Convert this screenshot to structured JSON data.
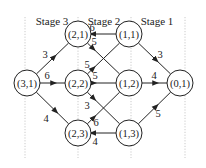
{
  "diagram": {
    "stages": [
      {
        "label": "Stage 3",
        "x": 52,
        "y": 25
      },
      {
        "label": "Stage 2",
        "x": 104,
        "y": 25
      },
      {
        "label": "Stage 1",
        "x": 157,
        "y": 25
      }
    ],
    "guides_x": [
      25,
      78,
      131,
      185
    ],
    "guides_y": [
      17,
      158
    ],
    "node_radius": 13,
    "nodes": [
      {
        "id": "3,1",
        "label": "(3,1)",
        "x": 27,
        "y": 83
      },
      {
        "id": "2,1",
        "label": "(2,1)",
        "x": 78,
        "y": 34
      },
      {
        "id": "2,2",
        "label": "(2,2)",
        "x": 78,
        "y": 83
      },
      {
        "id": "2,3",
        "label": "(2,3)",
        "x": 78,
        "y": 133
      },
      {
        "id": "1,1",
        "label": "(1,1)",
        "x": 129,
        "y": 34
      },
      {
        "id": "1,2",
        "label": "(1,2)",
        "x": 129,
        "y": 83
      },
      {
        "id": "1,3",
        "label": "(1,3)",
        "x": 129,
        "y": 133
      },
      {
        "id": "0,1",
        "label": "(0,1)",
        "x": 180,
        "y": 83
      }
    ],
    "edges": [
      {
        "from": "3,1",
        "to": "2,1",
        "weight": "3",
        "arrow_t": 0.55,
        "lx": 45,
        "ly": 58
      },
      {
        "from": "3,1",
        "to": "2,2",
        "weight": "6",
        "arrow_t": 0.55,
        "lx": 47,
        "ly": 79
      },
      {
        "from": "3,1",
        "to": "2,3",
        "weight": "4",
        "arrow_t": 0.6,
        "lx": 46,
        "ly": 122
      },
      {
        "from": "1,1",
        "to": "2,1",
        "weight": "6",
        "arrow_t": 0.93,
        "lx": 92,
        "ly": 31
      },
      {
        "from": "2,1",
        "to": "1,2",
        "weight": "5",
        "arrow_t": 0.18,
        "lx": 94,
        "ly": 45
      },
      {
        "from": "2,2",
        "to": "1,1",
        "weight": "5",
        "arrow_t": 0.18,
        "lx": 87,
        "ly": 68
      },
      {
        "from": "2,2",
        "to": "1,2",
        "weight": "5",
        "arrow_t": 0.1,
        "lx": 95,
        "ly": 79
      },
      {
        "from": "2,2",
        "to": "1,3",
        "weight": "3",
        "arrow_t": 0.2,
        "lx": 87,
        "ly": 109
      },
      {
        "from": "2,3",
        "to": "1,2",
        "weight": "6",
        "arrow_t": 0.2,
        "lx": 96,
        "ly": 126
      },
      {
        "from": "1,3",
        "to": "2,3",
        "weight": "4",
        "arrow_t": 0.93,
        "lx": 95,
        "ly": 145
      },
      {
        "from": "1,1",
        "to": "0,1",
        "weight": "3",
        "arrow_t": 0.55,
        "lx": 160,
        "ly": 58
      },
      {
        "from": "1,2",
        "to": "0,1",
        "weight": "4",
        "arrow_t": 0.55,
        "lx": 154,
        "ly": 79
      },
      {
        "from": "1,3",
        "to": "0,1",
        "weight": "5",
        "arrow_t": 0.55,
        "lx": 158,
        "ly": 117
      }
    ]
  }
}
